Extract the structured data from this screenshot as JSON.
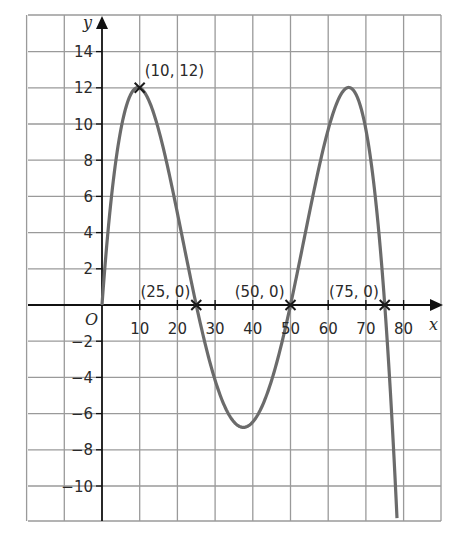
{
  "chart_data": {
    "type": "line",
    "title": "",
    "xlabel": "x",
    "ylabel": "y",
    "origin_label": "O",
    "xlim": [
      -20,
      90
    ],
    "ylim": [
      -12,
      16
    ],
    "grid": true,
    "x_ticks": [
      10,
      20,
      30,
      40,
      50,
      60,
      70,
      80
    ],
    "x_tick_labels": [
      "10",
      "20",
      "30",
      "40",
      "50",
      "60",
      "70",
      "80"
    ],
    "y_ticks": [
      14,
      12,
      10,
      8,
      6,
      4,
      2,
      -2,
      -4,
      -6,
      -8,
      -10
    ],
    "y_tick_labels": [
      "14",
      "12",
      "10",
      "8",
      "6",
      "4",
      "2",
      "−2",
      "−4",
      "−6",
      "−8",
      "−10"
    ],
    "series": [
      {
        "name": "curve",
        "formula": "y = k·x(x−25)(x−50)(x−75), k = −12/390000",
        "color": "#6b6b6b",
        "x": [
          0,
          5,
          10,
          15,
          20,
          25,
          30,
          37.5,
          45,
          50,
          55,
          60,
          65,
          70,
          75,
          78.5
        ],
        "y": [
          0,
          9.6,
          12,
          9.7,
          4.6,
          0,
          -4.4,
          -6.8,
          -4.4,
          0,
          4.6,
          9.7,
          12,
          9.6,
          0,
          -12
        ]
      }
    ],
    "annotations": [
      {
        "label": "(10, 12)",
        "x": 10,
        "y": 12,
        "marker": "x"
      },
      {
        "label": "(25, 0)",
        "x": 25,
        "y": 0,
        "marker": "x"
      },
      {
        "label": "(50, 0)",
        "x": 50,
        "y": 0,
        "marker": "x"
      },
      {
        "label": "(75, 0)",
        "x": 75,
        "y": 0,
        "marker": "x"
      }
    ],
    "colors": {
      "grid": "#9a9a9a",
      "axis": "#111111",
      "curve": "#6b6b6b",
      "text": "#2a2a2a"
    }
  }
}
